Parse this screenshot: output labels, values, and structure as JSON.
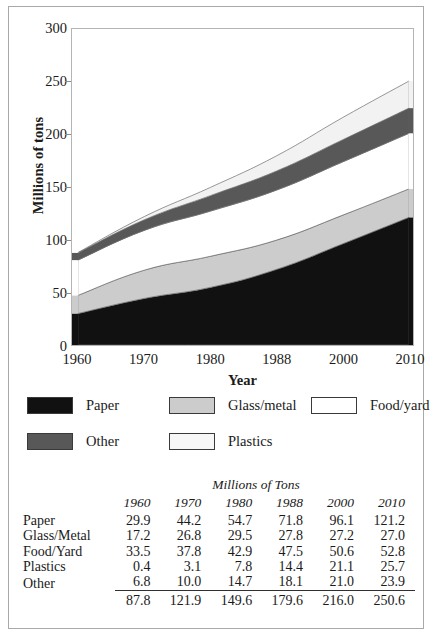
{
  "chart_data": {
    "type": "area",
    "stacked": true,
    "title": "",
    "xlabel": "Year",
    "ylabel": "Millions of tons",
    "ylim": [
      0,
      300
    ],
    "yticks": [
      0,
      50,
      100,
      150,
      200,
      250,
      300
    ],
    "grid": false,
    "legend_position": "below",
    "categories": [
      "1960",
      "1970",
      "1980",
      "1988",
      "2000",
      "2010"
    ],
    "x": [
      1960,
      1970,
      1980,
      1988,
      2000,
      2010
    ],
    "series": [
      {
        "name": "Paper",
        "values": [
          29.9,
          44.2,
          54.7,
          71.8,
          96.1,
          121.2
        ],
        "color": "#111111"
      },
      {
        "name": "Glass/metal",
        "values": [
          17.2,
          26.8,
          29.5,
          27.8,
          27.2,
          27.0
        ],
        "color": "#cccccc"
      },
      {
        "name": "Food/yard",
        "values": [
          33.5,
          37.8,
          42.9,
          47.5,
          50.6,
          52.8
        ],
        "color": "#ffffff"
      },
      {
        "name": "Other",
        "values": [
          6.8,
          10.0,
          14.7,
          18.1,
          21.0,
          23.9
        ],
        "color": "#585858"
      },
      {
        "name": "Plastics",
        "values": [
          0.4,
          3.1,
          7.8,
          14.4,
          21.1,
          25.7
        ],
        "color": "#f2f2f2"
      }
    ],
    "totals": [
      87.8,
      121.9,
      149.6,
      179.6,
      216.0,
      250.6
    ]
  },
  "chart": {
    "ylabel": "Millions of tons",
    "xlabel": "Year",
    "ytick_labels": [
      "300",
      "250",
      "200",
      "150",
      "100",
      "50",
      "0"
    ],
    "xtick_labels": [
      "1960",
      "1970",
      "1980",
      "1988",
      "2000",
      "2010"
    ]
  },
  "legend": {
    "items": [
      {
        "label": "Paper",
        "color": "#111111"
      },
      {
        "label": "Glass/metal",
        "color": "#cccccc"
      },
      {
        "label": "Food/yard",
        "color": "#ffffff"
      },
      {
        "label": "Other",
        "color": "#585858"
      },
      {
        "label": "Plastics",
        "color": "#f7f7f7"
      }
    ]
  },
  "table": {
    "title": "Millions of Tons",
    "year_headers": [
      "1960",
      "1970",
      "1980",
      "1988",
      "2000",
      "2010"
    ],
    "rows": [
      {
        "label": "Paper",
        "values": [
          "29.9",
          "44.2",
          "54.7",
          "71.8",
          "96.1",
          "121.2"
        ]
      },
      {
        "label": "Glass/Metal",
        "values": [
          "17.2",
          "26.8",
          "29.5",
          "27.8",
          "27.2",
          "27.0"
        ]
      },
      {
        "label": "Food/Yard",
        "values": [
          "33.5",
          "37.8",
          "42.9",
          "47.5",
          "50.6",
          "52.8"
        ]
      },
      {
        "label": "Plastics",
        "values": [
          "0.4",
          "3.1",
          "7.8",
          "14.4",
          "21.1",
          "25.7"
        ]
      },
      {
        "label": "Other",
        "values": [
          "6.8",
          "10.0",
          "14.7",
          "18.1",
          "21.0",
          "23.9"
        ]
      }
    ],
    "total_label": "",
    "totals": [
      "87.8",
      "121.9",
      "149.6",
      "179.6",
      "216.0",
      "250.6"
    ]
  }
}
